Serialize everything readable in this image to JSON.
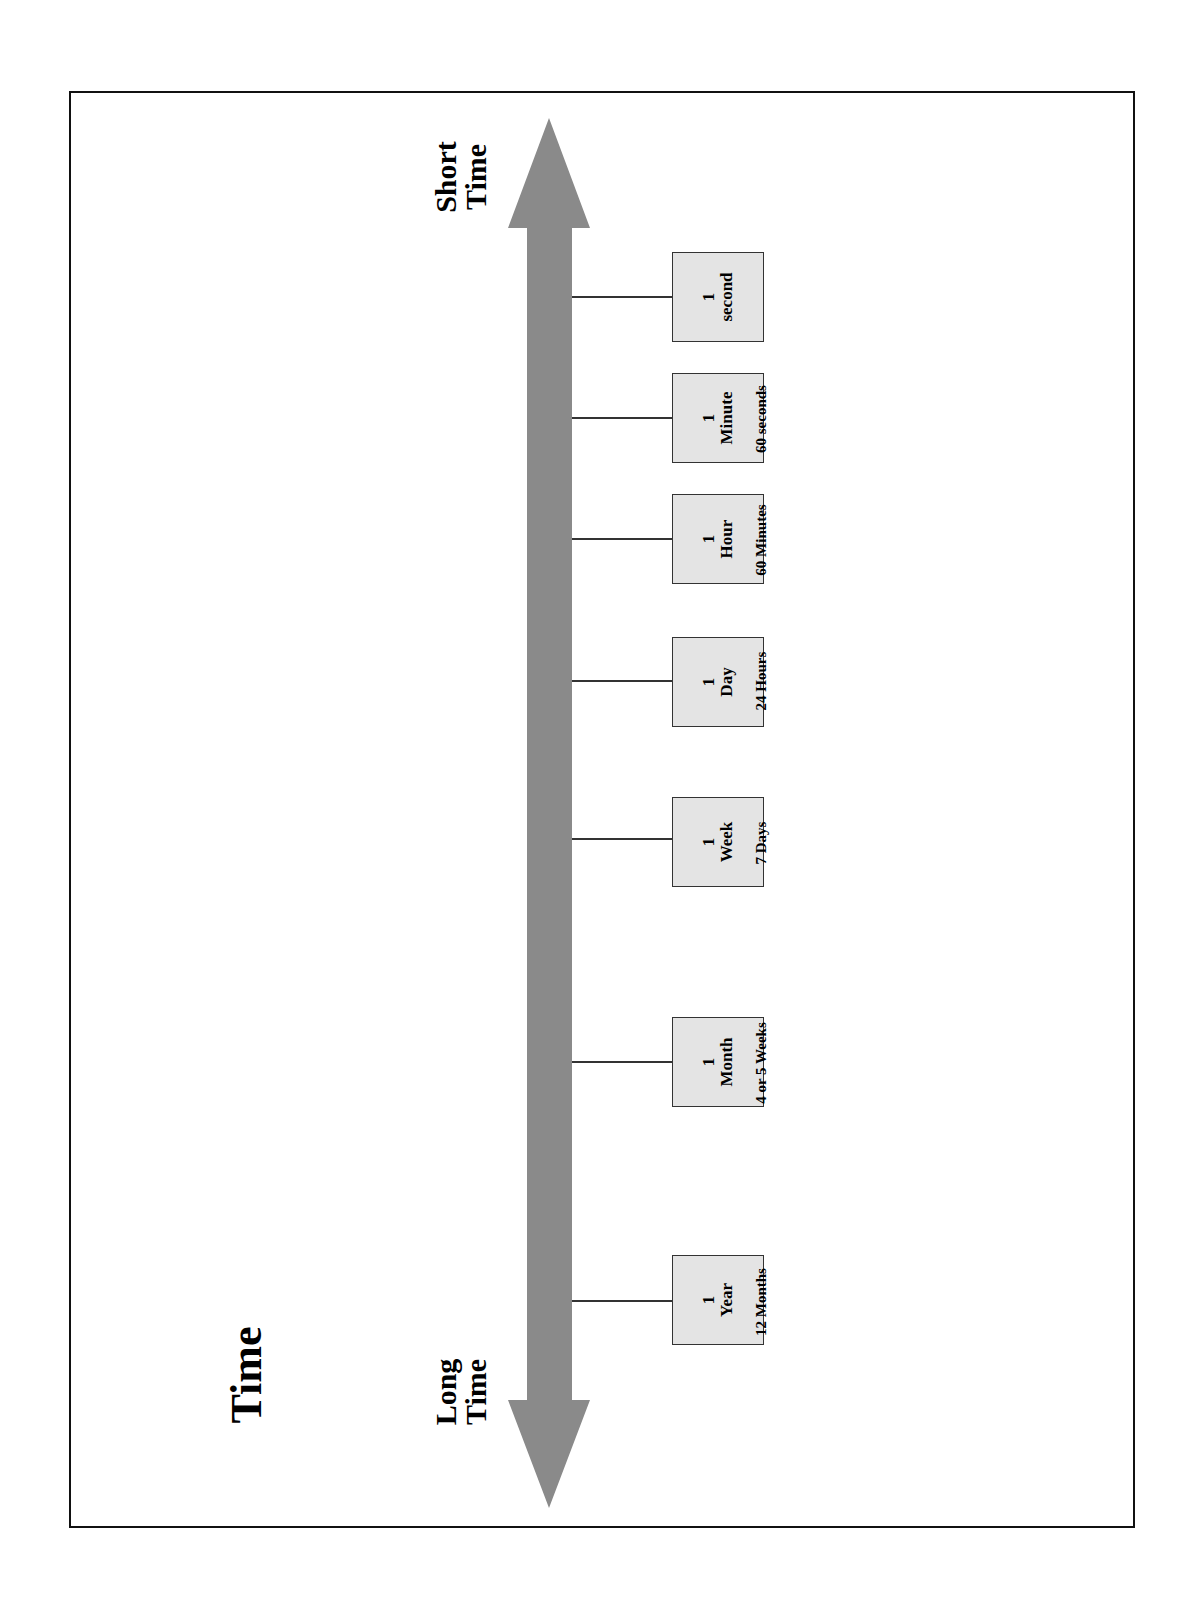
{
  "title": "Time",
  "axis": {
    "top_label_line1": "Short",
    "top_label_line2": "Time",
    "bottom_label_line1": "Long",
    "bottom_label_line2": "Time",
    "arrow_color": "#8a8a8a"
  },
  "box_fill": "#e4e4e4",
  "units": [
    {
      "qty": "1",
      "unit": "second",
      "equivalent": "",
      "y": 297
    },
    {
      "qty": "1",
      "unit": "Minute",
      "equivalent": "60 seconds",
      "y": 418
    },
    {
      "qty": "1",
      "unit": "Hour",
      "equivalent": "60 Minutes",
      "y": 539
    },
    {
      "qty": "1",
      "unit": "Day",
      "equivalent": "24 Hours",
      "y": 681
    },
    {
      "qty": "1",
      "unit": "Week",
      "equivalent": "7 Days",
      "y": 838
    },
    {
      "qty": "1",
      "unit": "Month",
      "equivalent": "4 or 5 Weeks",
      "y": 1051
    },
    {
      "qty": "1",
      "unit": "Year",
      "equivalent": "12 Months",
      "y": 1300
    }
  ]
}
